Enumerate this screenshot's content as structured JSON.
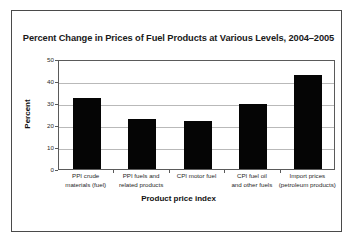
{
  "figure": {
    "frame_color": "#4a4a4a",
    "background": "#ffffff"
  },
  "chart_data": {
    "type": "bar",
    "title": "Percent Change in Prices of Fuel Products at Various Levels, 2004–2005",
    "xlabel": "Product price index",
    "ylabel": "Percent",
    "categories": [
      "PPI crude materials (fuel)",
      "PPI fuels and related products",
      "CPI motor fuel",
      "CPI fuel oil and other fuels",
      "Import prices (petroleum products)"
    ],
    "category_lines": [
      [
        "PPI crude",
        "materials (fuel)"
      ],
      [
        "PPI fuels and",
        "related products"
      ],
      [
        "CPI motor fuel",
        ""
      ],
      [
        "CPI fuel oil",
        "and other fuels"
      ],
      [
        "Import prices",
        "(petroleum products)"
      ]
    ],
    "values": [
      32.2,
      22.6,
      21.7,
      29.7,
      42.8
    ],
    "ylim": [
      0,
      50
    ],
    "yticks": [
      0,
      10,
      20,
      30,
      40,
      50
    ],
    "ytick_labels": [
      "0",
      "10",
      "20",
      "30",
      "40",
      "50"
    ],
    "grid": true,
    "grid_axis": "y",
    "legend": "none",
    "bar_color": "#050505",
    "gridline_color": "#b9b9b9",
    "axis_color": "#5a5a5a"
  }
}
